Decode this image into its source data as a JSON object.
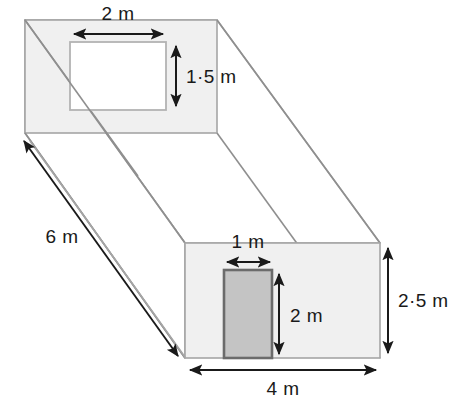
{
  "figure": {
    "type": "3d-cuboid-dimension-diagram",
    "units": "m",
    "colors": {
      "background": "#ffffff",
      "face_fill": "#f0f0f0",
      "face_stroke": "#a6a6a6",
      "hidden_stroke": "#a6a6a6",
      "opening_fill": "#ffffff",
      "opening_stroke": "#b3b3b3",
      "door_fill": "#c4c4c4",
      "door_stroke": "#6b6b6b",
      "dimension_line": "#1a1a1a",
      "dimension_text": "#1a1a1a"
    }
  },
  "dimensions": {
    "window_width": {
      "value": "2 m",
      "orientation": "horizontal",
      "belongs_to": "back-face-window"
    },
    "window_height": {
      "value": "1·5 m",
      "orientation": "vertical",
      "belongs_to": "back-face-window"
    },
    "depth": {
      "value": "6 m",
      "orientation": "diagonal",
      "belongs_to": "cuboid-depth"
    },
    "door_width": {
      "value": "1 m",
      "orientation": "horizontal",
      "belongs_to": "front-face-door"
    },
    "door_height": {
      "value": "2 m",
      "orientation": "vertical",
      "belongs_to": "front-face-door"
    },
    "front_height": {
      "value": "2·5 m",
      "orientation": "vertical",
      "belongs_to": "cuboid-height"
    },
    "front_width": {
      "value": "4 m",
      "orientation": "horizontal",
      "belongs_to": "cuboid-width"
    }
  },
  "geometry": {
    "back_face": {
      "x1": 25,
      "y1": 20,
      "x2": 217,
      "y2": 133
    },
    "front_face": {
      "x1": 185,
      "y1": 243,
      "x2": 380,
      "y2": 358
    },
    "window": {
      "x1": 70,
      "y1": 42,
      "x2": 166,
      "y2": 110
    },
    "door": {
      "x1": 224,
      "y1": 270,
      "x2": 272,
      "y2": 358
    }
  }
}
